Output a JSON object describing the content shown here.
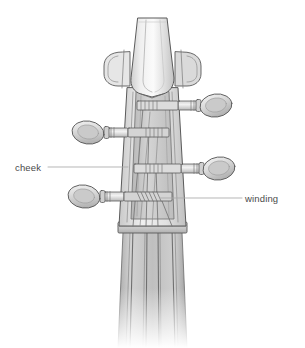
{
  "figure": {
    "background_color": "#ffffff",
    "line_color": "#5a5a5a",
    "fill_light": "#f2f2f2",
    "fill_mid": "#d8d8d8",
    "fill_dark": "#b8b8b8",
    "leader_color": "#a9a9a9",
    "text_color": "#4a4a4a"
  },
  "labels": [
    {
      "id": "cheek",
      "text": "cheek",
      "side": "left",
      "text_x": 15,
      "text_y": 163,
      "leader": {
        "x1": 48,
        "y1": 167,
        "x2": 128,
        "y2": 167
      }
    },
    {
      "id": "winding",
      "text": "winding",
      "side": "right",
      "text_x": 245,
      "text_y": 194,
      "leader": {
        "x1": 160,
        "y1": 198,
        "x2": 242,
        "y2": 198
      }
    }
  ],
  "parts": {
    "scroll_label": "scroll",
    "pegbox_label": "pegbox",
    "nut_label": "nut",
    "fingerboard_label": "fingerboard",
    "peg_count": 4,
    "string_count": 4
  }
}
